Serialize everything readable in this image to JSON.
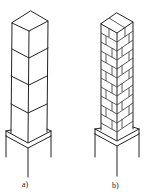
{
  "figure": {
    "panels": [
      {
        "id": "a",
        "label": "a)",
        "description": "Column composed of stacked solid blocks (4 segments) on a base plinth",
        "segments": 4,
        "type": "solid-block-column"
      },
      {
        "id": "b",
        "label": "b)",
        "description": "Column composed of staggered bricks on a base plinth",
        "courses": 13,
        "type": "brick-column"
      }
    ],
    "line_color": "#222222",
    "background": "#ffffff"
  }
}
